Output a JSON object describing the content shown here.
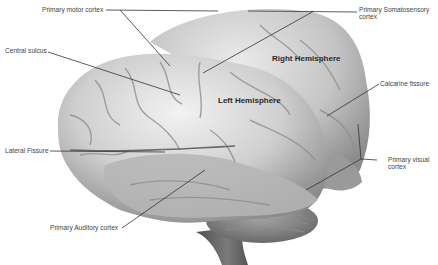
{
  "diagram": {
    "regions": {
      "right_hemisphere": "Right Hemisphere",
      "left_hemisphere": "Left Hemisphere"
    },
    "labels": {
      "primary_motor_cortex": "Primary motor cortex",
      "primary_somatosensory_cortex_line1": "Primary Somatosensory",
      "primary_somatosensory_cortex_line2": "cortex",
      "central_sulcus": "Central sulcus",
      "calcarine_fissure": "Calcarine fissure",
      "lateral_fissure": "Lateral Fissure",
      "primary_visual_cortex_line1": "Primary visual",
      "primary_visual_cortex_line2": "cortex",
      "primary_auditory_cortex": "Primary Auditory cortex"
    },
    "colors": {
      "background": "#ffffff",
      "leader_line": "#333333",
      "brain_light": "#e4e4e4",
      "brain_mid": "#b8b8b8",
      "brain_dark": "#6e6e6e"
    }
  }
}
